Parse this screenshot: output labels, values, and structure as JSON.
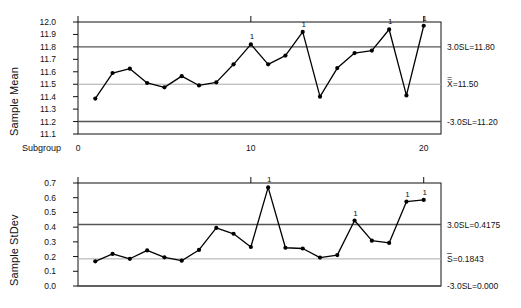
{
  "figure": {
    "kind": "xbar-s-control-chart",
    "background": "#ffffff",
    "line_color": "#000000",
    "marker_color": "#000000",
    "limit_color": "#555555",
    "center_color": "#aaaaaa"
  },
  "charts": [
    {
      "id": "xbar",
      "y_axis_title": "Sample Mean",
      "x_axis_title": "Subgroup",
      "x_ticks": [
        "0",
        "10",
        "20"
      ],
      "x_tick_values": [
        0,
        10,
        20
      ],
      "y_ticks": [
        "12.0",
        "11.9",
        "11.8",
        "11.7",
        "11.6",
        "11.5",
        "11.4",
        "11.3",
        "11.2",
        "11.1"
      ],
      "annotations": [
        {
          "name": "ucl",
          "text": "3.0SL=11.80",
          "overline": "",
          "value": 11.8
        },
        {
          "name": "center",
          "text": "X=11.50",
          "overline": "=",
          "value": 11.5
        },
        {
          "name": "lcl",
          "text": "-3.0SL=11.20",
          "overline": "",
          "value": 11.2
        }
      ]
    },
    {
      "id": "sdev",
      "y_axis_title": "Sample StDev",
      "x_axis_title": "",
      "x_ticks": [],
      "x_tick_values": [
        0,
        10,
        20
      ],
      "y_ticks": [
        "0.7",
        "0.6",
        "0.5",
        "0.4",
        "0.3",
        "0.2",
        "0.1",
        "0.0"
      ],
      "annotations": [
        {
          "name": "ucl",
          "text": "3.0SL=0.4175",
          "overline": "",
          "value": 0.4175
        },
        {
          "name": "center",
          "text": "S=0.1843",
          "overline": "–",
          "value": 0.1843
        },
        {
          "name": "lcl",
          "text": "-3.0SL=0.000",
          "overline": "",
          "value": 0.0
        }
      ]
    }
  ],
  "chart_data": [
    {
      "type": "line",
      "id": "xbar-chart",
      "title": "",
      "xlabel": "Subgroup",
      "ylabel": "Sample Mean",
      "x": [
        1,
        2,
        3,
        4,
        5,
        6,
        7,
        8,
        9,
        10,
        11,
        12,
        13,
        14,
        15,
        16,
        17,
        18,
        19,
        20
      ],
      "values": [
        11.385,
        11.59,
        11.625,
        11.51,
        11.475,
        11.565,
        11.49,
        11.515,
        11.66,
        11.82,
        11.66,
        11.73,
        11.92,
        11.4,
        11.63,
        11.75,
        11.77,
        11.94,
        11.41,
        11.97
      ],
      "ylim": [
        11.1,
        12.0
      ],
      "xlim": [
        0,
        21
      ],
      "yticks": [
        11.1,
        11.2,
        11.3,
        11.4,
        11.5,
        11.6,
        11.7,
        11.8,
        11.9,
        12.0
      ],
      "xticks": [
        0,
        10,
        20
      ],
      "grid": false,
      "center_line": 11.5,
      "upper_control_limit": 11.8,
      "lower_control_limit": 11.2,
      "violation_label": "1",
      "violation_points": [
        10,
        13,
        18,
        20
      ],
      "legend": []
    },
    {
      "type": "line",
      "id": "sdev-chart",
      "title": "",
      "xlabel": "",
      "ylabel": "Sample StDev",
      "x": [
        1,
        2,
        3,
        4,
        5,
        6,
        7,
        8,
        9,
        10,
        11,
        12,
        13,
        14,
        15,
        16,
        17,
        18,
        19,
        20
      ],
      "values": [
        0.168,
        0.218,
        0.185,
        0.242,
        0.195,
        0.172,
        0.245,
        0.395,
        0.355,
        0.265,
        0.67,
        0.26,
        0.255,
        0.193,
        0.21,
        0.445,
        0.308,
        0.293,
        0.573,
        0.585
      ],
      "ylim": [
        0.0,
        0.7
      ],
      "xlim": [
        0,
        21
      ],
      "yticks": [
        0.0,
        0.1,
        0.2,
        0.3,
        0.4,
        0.5,
        0.6,
        0.7
      ],
      "xticks": [
        0,
        10,
        20
      ],
      "grid": false,
      "center_line": 0.1843,
      "upper_control_limit": 0.4175,
      "lower_control_limit": 0.0,
      "violation_label": "1",
      "violation_points": [
        11,
        16,
        19,
        20
      ],
      "legend": []
    }
  ]
}
